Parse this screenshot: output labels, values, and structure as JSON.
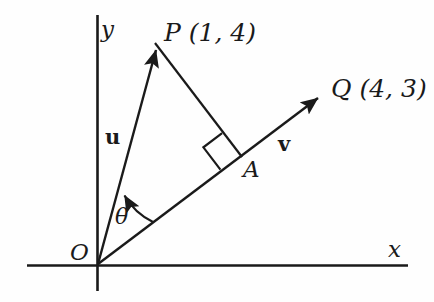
{
  "figure": {
    "background_color": "#fefefe",
    "stroke_color": "#1a1a1a",
    "axes": {
      "x_axis_label": "x",
      "y_axis_label": "y",
      "origin_label": "O"
    },
    "points": [
      {
        "name": "origin",
        "label": "O",
        "x": 98,
        "y": 265
      },
      {
        "name": "point-P",
        "label": "P (1, 4)",
        "x": 155,
        "y": 42
      },
      {
        "name": "point-Q",
        "label": "Q (4, 3)",
        "x": 325,
        "y": 93
      },
      {
        "name": "point-A",
        "label": "A",
        "x": 240,
        "y": 155
      }
    ],
    "vectors": [
      {
        "name": "vector-u",
        "label": "u",
        "from": "O",
        "to": "P",
        "style": "bold-arrow"
      },
      {
        "name": "vector-v",
        "label": "v",
        "from": "O",
        "to": "Q",
        "style": "bold-arrow"
      }
    ],
    "angle": {
      "label": "θ",
      "between": [
        "u",
        "v"
      ],
      "vertex": "O"
    },
    "markers": {
      "right_angle_at": "A",
      "right_angle_label": ""
    },
    "segments": [
      {
        "name": "segment-PA",
        "from": "P",
        "to": "A",
        "style": "plain"
      }
    ]
  }
}
